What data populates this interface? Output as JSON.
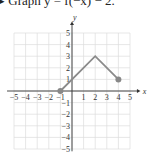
{
  "title": "▸ Graph y = f(−x) − 2.",
  "chart_data": {
    "type": "line",
    "title": "Graph y = f(−x) − 2.",
    "xlabel": "x",
    "ylabel": "y",
    "xlim": [
      -5,
      5
    ],
    "ylim": [
      -5,
      5
    ],
    "grid": true,
    "x_ticks": [
      "-5",
      "-4",
      "-3",
      "-2",
      "-1",
      "1",
      "2",
      "3",
      "4",
      "5"
    ],
    "y_ticks": [
      "5",
      "4",
      "3",
      "2",
      "1",
      "-1",
      "-2",
      "-3",
      "-4",
      "-5"
    ],
    "series": [
      {
        "name": "f",
        "points": [
          [
            -1,
            0
          ],
          [
            2,
            3
          ],
          [
            4,
            1
          ]
        ],
        "endpoints_marked": true,
        "color": "#8a8a8a"
      }
    ]
  },
  "colors": {
    "line": "#8a8a8a",
    "grid": "#dcdcdc",
    "axis": "#333333",
    "dot": "#888888"
  }
}
